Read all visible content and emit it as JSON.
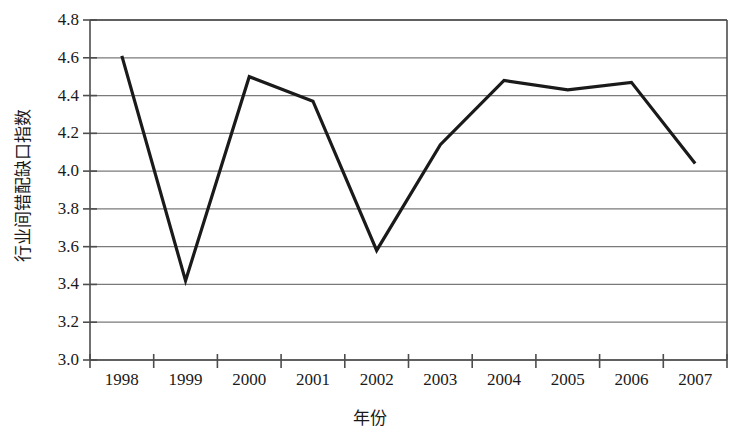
{
  "chart_data": {
    "type": "line",
    "title": "",
    "xlabel": "年份",
    "ylabel": "行业间错配缺口指数",
    "categories": [
      "1998",
      "1999",
      "2000",
      "2001",
      "2002",
      "2003",
      "2004",
      "2005",
      "2006",
      "2007"
    ],
    "values": [
      4.61,
      3.42,
      4.5,
      4.37,
      3.58,
      4.14,
      4.48,
      4.43,
      4.47,
      4.04
    ],
    "series": [
      {
        "name": "行业间错配缺口指数",
        "values": [
          4.61,
          3.42,
          4.5,
          4.37,
          3.58,
          4.14,
          4.48,
          4.43,
          4.47,
          4.04
        ]
      }
    ],
    "ylim": [
      3.0,
      4.8
    ],
    "ytick_labels": [
      "4.8",
      "4.6",
      "4.4",
      "4.2",
      "4.0",
      "3.8",
      "3.6",
      "3.4",
      "3.2",
      "3.0"
    ],
    "ytick_values": [
      4.8,
      4.6,
      4.4,
      4.2,
      4.0,
      3.8,
      3.6,
      3.4,
      3.2,
      3.0
    ],
    "xtick_labels": [
      "1998",
      "1999",
      "2000",
      "2001",
      "2002",
      "2003",
      "2004",
      "2005",
      "2006",
      "2007"
    ],
    "grid": true,
    "grid_axis": "y",
    "legend": false,
    "legend_position": "none",
    "line_color": "#1a1a1a",
    "grid_color": "#7a7a7a",
    "axis_color": "#4d4d4d",
    "background_color": "#ffffff",
    "markers": false
  },
  "axes": {
    "y_title": "行业间错配缺口指数",
    "x_title": "年份"
  }
}
